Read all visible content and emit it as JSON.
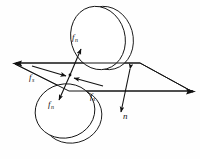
{
  "figure": {
    "name": "two-disk-contact-force-diagram",
    "background_color": "#fefefe",
    "line_color": "#141414",
    "caption": ""
  },
  "labels": {
    "normal_force_top": {
      "symbol": "f",
      "subscript": "n",
      "text": "f"
    },
    "normal_force_bottom": {
      "symbol": "f",
      "subscript": "n",
      "text": "f"
    },
    "shear_force_left": {
      "symbol": "f",
      "subscript": "s",
      "text": "f"
    },
    "shear_force_right": {
      "symbol": "f",
      "subscript": "s",
      "text": "f"
    },
    "normal_direction": {
      "symbol": "n",
      "subscript": "",
      "text": "n"
    }
  },
  "subscripts": {
    "n": "n",
    "s": "s",
    "none": ""
  },
  "elements": {
    "upper_disk": "upper-disk",
    "lower_disk": "lower-disk",
    "contact_plane": "contact-plane-parallelogram",
    "contact_point": "contact-point",
    "arrow_fn_up": "normal-force-up-arrow",
    "arrow_fn_down": "normal-force-down-arrow",
    "arrow_fs_left": "shear-force-left-arrow",
    "arrow_fs_right": "shear-force-right-arrow",
    "arrow_n": "normal-direction-double-arrow",
    "plane_axis_left": "plane-left-arrowhead",
    "plane_axis_right": "plane-right-arrowhead"
  }
}
